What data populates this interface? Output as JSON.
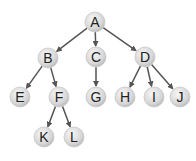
{
  "diagram": {
    "type": "tree",
    "nodes": [
      {
        "id": "A",
        "label": "A",
        "x": 95,
        "y": 22
      },
      {
        "id": "B",
        "label": "B",
        "x": 48,
        "y": 58
      },
      {
        "id": "C",
        "label": "C",
        "x": 96,
        "y": 57
      },
      {
        "id": "D",
        "label": "D",
        "x": 145,
        "y": 57
      },
      {
        "id": "E",
        "label": "E",
        "x": 20,
        "y": 97
      },
      {
        "id": "F",
        "label": "F",
        "x": 59,
        "y": 97
      },
      {
        "id": "G",
        "label": "G",
        "x": 96,
        "y": 97
      },
      {
        "id": "H",
        "label": "H",
        "x": 125,
        "y": 97
      },
      {
        "id": "I",
        "label": "I",
        "x": 154,
        "y": 97
      },
      {
        "id": "J",
        "label": "J",
        "x": 180,
        "y": 97
      },
      {
        "id": "K",
        "label": "K",
        "x": 44,
        "y": 137
      },
      {
        "id": "L",
        "label": "L",
        "x": 74,
        "y": 137
      }
    ],
    "edges": [
      [
        "A",
        "B"
      ],
      [
        "A",
        "C"
      ],
      [
        "A",
        "D"
      ],
      [
        "B",
        "E"
      ],
      [
        "B",
        "F"
      ],
      [
        "C",
        "G"
      ],
      [
        "D",
        "H"
      ],
      [
        "D",
        "I"
      ],
      [
        "D",
        "J"
      ],
      [
        "F",
        "K"
      ],
      [
        "F",
        "L"
      ]
    ],
    "colors": {
      "node_light": "#f4f4f4",
      "node_dark": "#bdbdbd",
      "edge": "#555555",
      "text": "#222222"
    }
  }
}
